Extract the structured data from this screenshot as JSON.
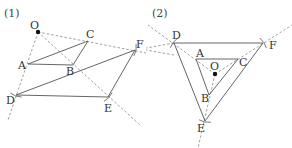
{
  "figures": [
    {
      "id": "fig1",
      "label": "(1)",
      "label_pos": [
        4,
        17
      ],
      "center": {
        "name": "O",
        "xy": [
          38,
          32
        ],
        "label_xy": [
          30,
          29
        ]
      },
      "points": {
        "A": {
          "xy": [
            28,
            64
          ],
          "label_xy": [
            18,
            69
          ]
        },
        "B": {
          "xy": [
            73,
            65
          ],
          "label_xy": [
            66,
            75
          ]
        },
        "C": {
          "xy": [
            88,
            41
          ],
          "label_xy": [
            86,
            38
          ]
        },
        "D": {
          "xy": [
            16,
            95
          ],
          "label_xy": [
            6,
            104
          ]
        },
        "E": {
          "xy": [
            108,
            97
          ],
          "label_xy": [
            104,
            112
          ]
        },
        "F": {
          "xy": [
            135,
            50
          ],
          "label_xy": [
            136,
            48
          ]
        }
      },
      "solid_segments": [
        [
          "A",
          "B"
        ],
        [
          "B",
          "C"
        ],
        [
          "C",
          "A"
        ],
        [
          "D",
          "E"
        ],
        [
          "E",
          "F"
        ],
        [
          "F",
          "D"
        ]
      ],
      "dashed_rays": [
        {
          "from": [
            38,
            32
          ],
          "to": [
            8,
            120
          ]
        },
        {
          "from": [
            38,
            32
          ],
          "to": [
            140,
            125
          ]
        },
        {
          "from": [
            38,
            32
          ],
          "to": [
            146,
            53
          ]
        }
      ]
    },
    {
      "id": "fig2",
      "label": "(2)",
      "label_pos": [
        152,
        17
      ],
      "center": {
        "name": "O",
        "xy": [
          215,
          74
        ],
        "label_xy": [
          210,
          70
        ]
      },
      "points": {
        "A": {
          "xy": [
            196,
            59
          ],
          "label_xy": [
            196,
            57
          ]
        },
        "B": {
          "xy": [
            209,
            95
          ],
          "label_xy": [
            201,
            102
          ]
        },
        "C": {
          "xy": [
            238,
            59
          ],
          "label_xy": [
            239,
            66
          ]
        },
        "D": {
          "xy": [
            174,
            43
          ],
          "label_xy": [
            172,
            39
          ]
        },
        "E": {
          "xy": [
            205,
            121
          ],
          "label_xy": [
            197,
            132
          ]
        },
        "F": {
          "xy": [
            263,
            43
          ],
          "label_xy": [
            269,
            49
          ]
        }
      },
      "solid_segments": [
        [
          "A",
          "B"
        ],
        [
          "B",
          "C"
        ],
        [
          "C",
          "A"
        ],
        [
          "D",
          "E"
        ],
        [
          "E",
          "F"
        ],
        [
          "F",
          "D"
        ]
      ],
      "dashed_rays": [
        {
          "from": [
            215,
            74
          ],
          "to": [
            148,
            25
          ]
        },
        {
          "from": [
            215,
            74
          ],
          "to": [
            292,
            25
          ]
        },
        {
          "from": [
            215,
            74
          ],
          "to": [
            198,
            148
          ]
        },
        {
          "from": [
            174,
            43
          ],
          "to": [
            146,
            48
          ]
        },
        {
          "from": [
            174,
            55
          ],
          "to": [
            146,
            50
          ]
        }
      ]
    }
  ],
  "colors": {
    "solid": "#555555",
    "dashed": "#888888",
    "point": "#111111",
    "text": "#333333"
  }
}
